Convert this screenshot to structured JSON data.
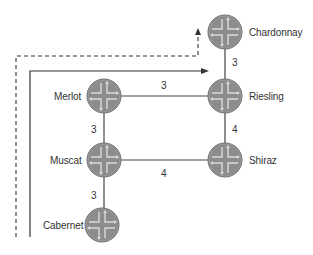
{
  "diagram": {
    "type": "network-topology",
    "colors": {
      "router_fill": "#8a8a8a",
      "router_edge": "#6e6e6e",
      "router_cross": "#d8d8d8",
      "link": "#444444",
      "path": "#333333",
      "text": "#333333"
    },
    "routers": [
      {
        "id": "chardonnay",
        "label": "Chardonnay",
        "icon": "router-icon"
      },
      {
        "id": "riesling",
        "label": "Riesling",
        "icon": "router-icon"
      },
      {
        "id": "merlot",
        "label": "Merlot",
        "icon": "router-icon"
      },
      {
        "id": "muscat",
        "label": "Muscat",
        "icon": "router-icon"
      },
      {
        "id": "shiraz",
        "label": "Shiraz",
        "icon": "router-icon"
      },
      {
        "id": "cabernet",
        "label": "Cabernet",
        "icon": "router-icon"
      }
    ],
    "links": [
      {
        "from": "chardonnay",
        "to": "riesling",
        "metric": "3"
      },
      {
        "from": "merlot",
        "to": "riesling",
        "metric": "3"
      },
      {
        "from": "merlot",
        "to": "muscat",
        "metric": "3"
      },
      {
        "from": "riesling",
        "to": "shiraz",
        "metric": "4"
      },
      {
        "from": "muscat",
        "to": "shiraz",
        "metric": "4"
      },
      {
        "from": "muscat",
        "to": "cabernet",
        "metric": "3"
      }
    ],
    "paths": [
      {
        "style": "solid",
        "direction": "up-then-right",
        "ends_at": "riesling",
        "arrow": "arrow-right-icon"
      },
      {
        "style": "dashed",
        "direction": "up-right-up",
        "ends_at": "chardonnay",
        "arrow": "arrow-up-icon"
      }
    ]
  }
}
